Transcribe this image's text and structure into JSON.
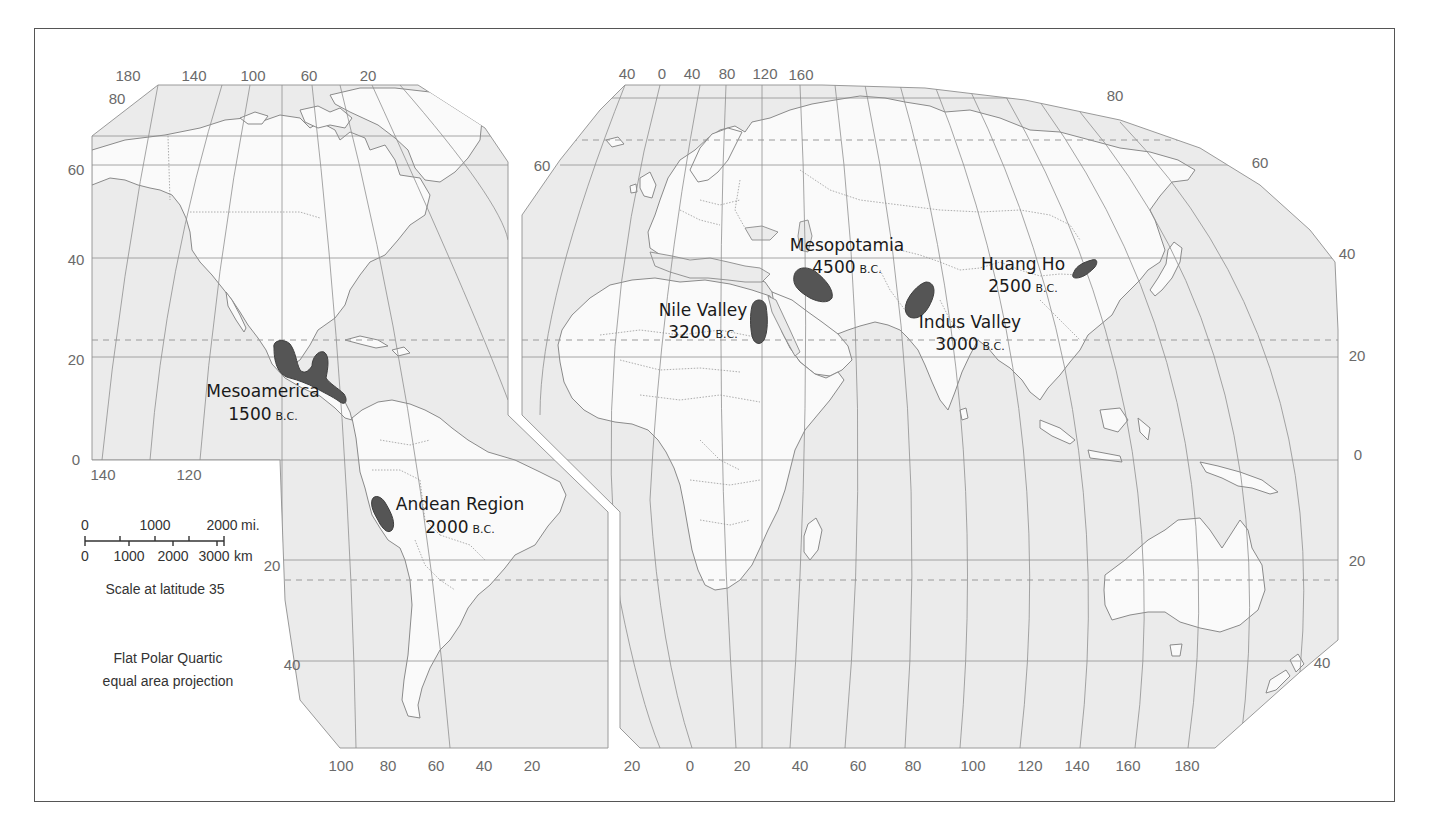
{
  "map": {
    "projection_note": [
      "Flat Polar Quartic",
      "equal area projection"
    ],
    "scale": {
      "miles_labels": [
        "0",
        "1000",
        "2000"
      ],
      "miles_unit": "mi.",
      "km_labels": [
        "0",
        "1000",
        "2000",
        "3000"
      ],
      "km_unit": "km",
      "caption": "Scale at latitude 35"
    },
    "hearths": [
      {
        "name": "Mesoamerica",
        "year": "1500",
        "era": "B.C."
      },
      {
        "name": "Andean Region",
        "year": "2000",
        "era": "B.C."
      },
      {
        "name": "Nile Valley",
        "year": "3200",
        "era": "B.C."
      },
      {
        "name": "Mesopotamia",
        "year": "4500",
        "era": "B.C."
      },
      {
        "name": "Indus Valley",
        "year": "3000",
        "era": "B.C."
      },
      {
        "name": "Huang Ho",
        "year": "2500",
        "era": "B.C."
      }
    ],
    "left_panel": {
      "top_longitudes": [
        "180",
        "140",
        "100",
        "60",
        "20"
      ],
      "left_latitudes": [
        "80",
        "60",
        "40",
        "20",
        "0"
      ],
      "mid_longitudes": [
        "140",
        "120"
      ],
      "south_latitudes": [
        "20",
        "40"
      ],
      "bottom_longitudes": [
        "100",
        "80",
        "60",
        "40",
        "20"
      ]
    },
    "right_panel": {
      "top_longitudes": [
        "40",
        "0",
        "40",
        "80",
        "120",
        "160"
      ],
      "left_latitudes": [
        "60"
      ],
      "right_latitudes": [
        "80",
        "60",
        "40",
        "20",
        "0",
        "20",
        "40"
      ],
      "bottom_longitudes": [
        "20",
        "0",
        "20",
        "40",
        "60",
        "80",
        "100",
        "120",
        "140",
        "160",
        "180"
      ]
    },
    "colors": {
      "ocean": "#ebebeb",
      "land": "#fafafa",
      "hearth": "#555555",
      "grid": "#8f8f8f"
    }
  }
}
